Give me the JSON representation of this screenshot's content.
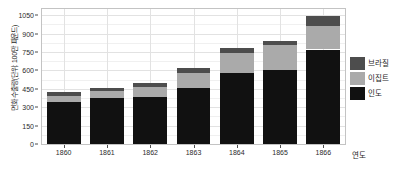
{
  "chart_data": {
    "type": "bar",
    "stacked": true,
    "title": "",
    "xlabel": "연도",
    "ylabel": "면화 수출량(단위: 100만 파운드)",
    "categories": [
      "1860",
      "1861",
      "1862",
      "1863",
      "1864",
      "1865",
      "1866"
    ],
    "series": [
      {
        "name": "인도",
        "color": "#111111",
        "values": [
          340,
          375,
          385,
          460,
          580,
          605,
          770
        ]
      },
      {
        "name": "이집트",
        "color": "#aaaaaa",
        "values": [
          55,
          55,
          80,
          120,
          165,
          200,
          190
        ]
      },
      {
        "name": "브라질",
        "color": "#4d4d4d",
        "values": [
          25,
          25,
          35,
          40,
          35,
          35,
          85
        ]
      }
    ],
    "totals": [
      420,
      455,
      500,
      620,
      780,
      840,
      1045
    ],
    "ylim": [
      0,
      1100
    ],
    "yticks": [
      0,
      150,
      300,
      450,
      600,
      750,
      900,
      1050
    ],
    "ytick_labels": [
      "0",
      "150",
      "300",
      "450",
      "600",
      "750",
      "900",
      "1050"
    ],
    "grid": true,
    "legend_position": "right",
    "legend_order": [
      "브라질",
      "이집트",
      "인도"
    ]
  },
  "legend": {
    "items": [
      {
        "label": "브라질",
        "color": "#4d4d4d"
      },
      {
        "label": "이집트",
        "color": "#aaaaaa"
      },
      {
        "label": "인도",
        "color": "#111111"
      }
    ]
  },
  "axes": {
    "y_title": "면화 수출량(단위: 100만 파운드)",
    "x_title": "연도"
  }
}
